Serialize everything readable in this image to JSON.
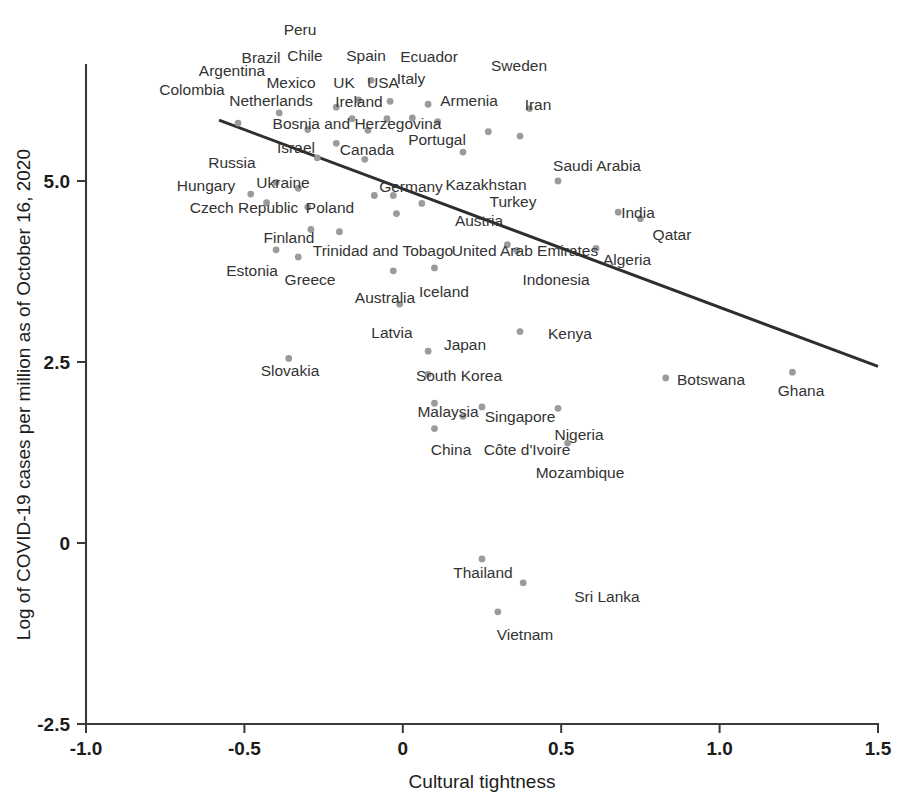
{
  "chart_data": {
    "type": "scatter",
    "title": "",
    "xlabel": "Cultural tightness",
    "ylabel": "Log of COVID-19 cases per million as of October 16, 2020",
    "xlim": [
      -1.0,
      1.5
    ],
    "ylim": [
      -2.5,
      6.6
    ],
    "xticks": [
      "-1.0",
      "-0.5",
      "0",
      "0.5",
      "1.0",
      "1.5"
    ],
    "xtick_values": [
      -1.0,
      -0.5,
      0,
      0.5,
      1.0,
      1.5
    ],
    "yticks": [
      "-2.5",
      "0",
      "2.5",
      "5.0"
    ],
    "ytick_values": [
      -2.5,
      0,
      2.5,
      5.0
    ],
    "grid": false,
    "legend": null,
    "point_color": "#9b9b9b",
    "line_color": "#2e2e2e",
    "trendline": {
      "label": "linear fit",
      "x0": -0.58,
      "y0": 5.84,
      "x1": 2.27,
      "y1": 1.18
    },
    "points": [
      {
        "label": "Peru",
        "x": -0.1,
        "y": 6.39,
        "lx": 300,
        "ly": 35,
        "lanchor": "middle"
      },
      {
        "label": "Chile",
        "x": -0.14,
        "y": 6.12,
        "lx": 305,
        "ly": 61,
        "lanchor": "middle"
      },
      {
        "label": "Spain",
        "x": -0.04,
        "y": 6.1,
        "lx": 366,
        "ly": 61,
        "lanchor": "middle"
      },
      {
        "label": "Ecuador",
        "x": 0.08,
        "y": 6.06,
        "lx": 429,
        "ly": 62,
        "lanchor": "middle"
      },
      {
        "label": "Brazil",
        "x": -0.21,
        "y": 6.02,
        "lx": 261,
        "ly": 63,
        "lanchor": "middle"
      },
      {
        "label": "Sweden",
        "x": 0.4,
        "y": 6.0,
        "lx": 519,
        "ly": 71,
        "lanchor": "middle"
      },
      {
        "label": "Argentina",
        "x": -0.39,
        "y": 5.94,
        "lx": 232,
        "ly": 76,
        "lanchor": "middle"
      },
      {
        "label": "Mexico",
        "x": -0.16,
        "y": 5.86,
        "lx": 291,
        "ly": 88,
        "lanchor": "middle"
      },
      {
        "label": "UK",
        "x": -0.05,
        "y": 5.86,
        "lx": 344,
        "ly": 88,
        "lanchor": "middle"
      },
      {
        "label": "USA",
        "x": 0.03,
        "y": 5.87,
        "lx": 383,
        "ly": 88,
        "lanchor": "middle"
      },
      {
        "label": "Italy",
        "x": 0.11,
        "y": 5.82,
        "lx": 411,
        "ly": 84,
        "lanchor": "middle"
      },
      {
        "label": "Colombia",
        "x": -0.52,
        "y": 5.8,
        "lx": 192,
        "ly": 95,
        "lanchor": "middle"
      },
      {
        "label": "Netherlands",
        "x": -0.3,
        "y": 5.71,
        "lx": 271,
        "ly": 106,
        "lanchor": "middle"
      },
      {
        "label": "Ireland",
        "x": -0.11,
        "y": 5.7,
        "lx": 359,
        "ly": 107,
        "lanchor": "middle"
      },
      {
        "label": "Armenia",
        "x": 0.27,
        "y": 5.68,
        "lx": 469,
        "ly": 106,
        "lanchor": "middle"
      },
      {
        "label": "Iran",
        "x": 0.37,
        "y": 5.62,
        "lx": 538,
        "ly": 110,
        "lanchor": "middle"
      },
      {
        "label": "Bosnia and Herzegovina",
        "x": -0.21,
        "y": 5.52,
        "lx": 357,
        "ly": 129,
        "lanchor": "middle"
      },
      {
        "label": "Portugal",
        "x": 0.19,
        "y": 5.4,
        "lx": 437,
        "ly": 145,
        "lanchor": "middle"
      },
      {
        "label": "Israel",
        "x": -0.27,
        "y": 5.32,
        "lx": 296,
        "ly": 153,
        "lanchor": "middle"
      },
      {
        "label": "Canada",
        "x": -0.12,
        "y": 5.3,
        "lx": 367,
        "ly": 155,
        "lanchor": "middle"
      },
      {
        "label": "Saudi Arabia",
        "x": 0.49,
        "y": 5.0,
        "lx": 597,
        "ly": 171,
        "lanchor": "middle"
      },
      {
        "label": "Russia",
        "x": -0.4,
        "y": 4.98,
        "lx": 232,
        "ly": 168,
        "lanchor": "middle"
      },
      {
        "label": "Ukraine",
        "x": -0.33,
        "y": 4.9,
        "lx": 283,
        "ly": 188,
        "lanchor": "middle"
      },
      {
        "label": "Hungary",
        "x": -0.48,
        "y": 4.82,
        "lx": 206,
        "ly": 191,
        "lanchor": "middle"
      },
      {
        "label": "Germany",
        "x": -0.09,
        "y": 4.8,
        "lx": 411,
        "ly": 192,
        "lanchor": "middle"
      },
      {
        "label": "Kazakhstan",
        "x": -0.03,
        "y": 4.8,
        "lx": 486,
        "ly": 190,
        "lanchor": "middle"
      },
      {
        "label": "Czech Republic",
        "x": -0.43,
        "y": 4.7,
        "lx": 244,
        "ly": 213,
        "lanchor": "middle"
      },
      {
        "label": "Poland",
        "x": -0.3,
        "y": 4.64,
        "lx": 330,
        "ly": 213,
        "lanchor": "middle"
      },
      {
        "label": "Turkey",
        "x": 0.06,
        "y": 4.69,
        "lx": 513,
        "ly": 207,
        "lanchor": "middle"
      },
      {
        "label": "India",
        "x": 0.68,
        "y": 4.57,
        "lx": 638,
        "ly": 218,
        "lanchor": "middle"
      },
      {
        "label": "Austria",
        "x": -0.02,
        "y": 4.55,
        "lx": 479,
        "ly": 226,
        "lanchor": "middle"
      },
      {
        "label": "Qatar",
        "x": 0.75,
        "y": 4.48,
        "lx": 672,
        "ly": 240,
        "lanchor": "middle"
      },
      {
        "label": "Finland",
        "x": -0.29,
        "y": 4.33,
        "lx": 289,
        "ly": 243,
        "lanchor": "middle"
      },
      {
        "label": "Trinidad and Tobago",
        "x": -0.2,
        "y": 4.3,
        "lx": 383,
        "ly": 256,
        "lanchor": "middle"
      },
      {
        "label": "United Arab Emirates",
        "x": 0.33,
        "y": 4.12,
        "lx": 525,
        "ly": 256,
        "lanchor": "middle"
      },
      {
        "label": "Algeria",
        "x": 0.61,
        "y": 4.07,
        "lx": 627,
        "ly": 265,
        "lanchor": "middle"
      },
      {
        "label": "Estonia",
        "x": -0.4,
        "y": 4.05,
        "lx": 252,
        "ly": 276,
        "lanchor": "middle"
      },
      {
        "label": "Greece",
        "x": -0.33,
        "y": 3.95,
        "lx": 310,
        "ly": 285,
        "lanchor": "middle"
      },
      {
        "label": "Indonesia",
        "x": 0.36,
        "y": 4.04,
        "lx": 556,
        "ly": 285,
        "lanchor": "middle"
      },
      {
        "label": "Iceland",
        "x": 0.1,
        "y": 3.8,
        "lx": 444,
        "ly": 297,
        "lanchor": "middle"
      },
      {
        "label": "Australia",
        "x": -0.03,
        "y": 3.76,
        "lx": 385,
        "ly": 303,
        "lanchor": "middle"
      },
      {
        "label": "Latvia",
        "x": -0.01,
        "y": 3.3,
        "lx": 392,
        "ly": 338,
        "lanchor": "middle"
      },
      {
        "label": "Kenya",
        "x": 0.37,
        "y": 2.92,
        "lx": 570,
        "ly": 339,
        "lanchor": "middle"
      },
      {
        "label": "Slovakia",
        "x": -0.36,
        "y": 2.55,
        "lx": 290,
        "ly": 376,
        "lanchor": "middle"
      },
      {
        "label": "Japan",
        "x": 0.08,
        "y": 2.65,
        "lx": 465,
        "ly": 350,
        "lanchor": "middle"
      },
      {
        "label": "Botswana",
        "x": 0.83,
        "y": 2.28,
        "lx": 711,
        "ly": 385,
        "lanchor": "middle"
      },
      {
        "label": "Ghana",
        "x": 1.23,
        "y": 2.36,
        "lx": 801,
        "ly": 396,
        "lanchor": "middle"
      },
      {
        "label": "South Korea",
        "x": 0.08,
        "y": 2.33,
        "lx": 459,
        "ly": 381,
        "lanchor": "middle"
      },
      {
        "label": "Malaysia",
        "x": 0.1,
        "y": 1.93,
        "lx": 448,
        "ly": 417,
        "lanchor": "middle"
      },
      {
        "label": "Singapore",
        "x": 0.25,
        "y": 1.88,
        "lx": 520,
        "ly": 422,
        "lanchor": "middle"
      },
      {
        "label": "Nigeria",
        "x": 0.49,
        "y": 1.86,
        "lx": 579,
        "ly": 440,
        "lanchor": "middle"
      },
      {
        "label": "China",
        "x": 0.1,
        "y": 1.58,
        "lx": 451,
        "ly": 455,
        "lanchor": "middle"
      },
      {
        "label": "Côte d'Ivoire",
        "x": 0.19,
        "y": 1.75,
        "lx": 527,
        "ly": 455,
        "lanchor": "middle"
      },
      {
        "label": "Mozambique",
        "x": 0.52,
        "y": 1.38,
        "lx": 580,
        "ly": 478,
        "lanchor": "middle"
      },
      {
        "label": "Thailand",
        "x": 0.25,
        "y": -0.22,
        "lx": 483,
        "ly": 578,
        "lanchor": "middle"
      },
      {
        "label": "Sri Lanka",
        "x": 0.38,
        "y": -0.55,
        "lx": 607,
        "ly": 602,
        "lanchor": "middle"
      },
      {
        "label": "Vietnam",
        "x": 0.3,
        "y": -0.95,
        "lx": 525,
        "ly": 640,
        "lanchor": "middle"
      }
    ]
  }
}
